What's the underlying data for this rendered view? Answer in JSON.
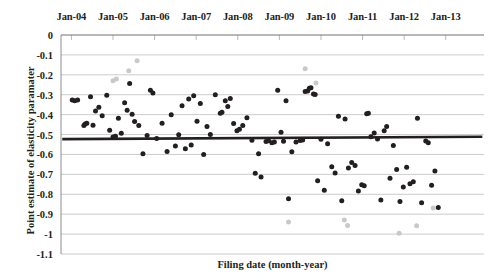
{
  "chart_data": {
    "type": "scatter",
    "title": "",
    "xlabel": "Filing date (month-year)",
    "ylabel": "Point estimate of elasticity paramater",
    "xlim": [
      2003.75,
      2013.92
    ],
    "ylim": [
      -1.1,
      0
    ],
    "grid": true,
    "legend": "none",
    "x_axis_position": "top",
    "y_ticks": [
      0,
      -0.1,
      -0.2,
      -0.3,
      -0.4,
      -0.5,
      -0.6,
      -0.7,
      -0.8,
      -0.9,
      -1,
      -1.1
    ],
    "y_tick_labels": [
      "0",
      "-0.1",
      "-0.2",
      "-0.3",
      "-0.4",
      "-0.5",
      "-0.6",
      "-0.7",
      "-0.8",
      "-0.9",
      "-1",
      "-1.1"
    ],
    "x_ticks": [
      2004,
      2005,
      2006,
      2007,
      2008,
      2009,
      2010,
      2011,
      2012,
      2013
    ],
    "x_tick_labels": [
      "Jan-04",
      "Jan-05",
      "Jan-06",
      "Jan-07",
      "Jan-08",
      "Jan-09",
      "Jan-10",
      "Jan-11",
      "Jan-12",
      "Jan-13"
    ],
    "series": [
      {
        "name": "point-estimates",
        "marker": "circle",
        "color": "#231f20",
        "points": [
          [
            2004.02,
            -0.327
          ],
          [
            2004.08,
            -0.33
          ],
          [
            2004.15,
            -0.327
          ],
          [
            2004.3,
            -0.455
          ],
          [
            2004.33,
            -0.447
          ],
          [
            2004.37,
            -0.443
          ],
          [
            2004.46,
            -0.31
          ],
          [
            2004.52,
            -0.453
          ],
          [
            2004.58,
            -0.382
          ],
          [
            2004.66,
            -0.363
          ],
          [
            2004.74,
            -0.405
          ],
          [
            2004.85,
            -0.303
          ],
          [
            2004.92,
            -0.478
          ],
          [
            2005.0,
            -0.512
          ],
          [
            2005.06,
            -0.508
          ],
          [
            2005.13,
            -0.418
          ],
          [
            2005.2,
            -0.493
          ],
          [
            2005.28,
            -0.34
          ],
          [
            2005.34,
            -0.378
          ],
          [
            2005.4,
            -0.244
          ],
          [
            2005.46,
            -0.398
          ],
          [
            2005.52,
            -0.434
          ],
          [
            2005.62,
            -0.455
          ],
          [
            2005.72,
            -0.597
          ],
          [
            2005.82,
            -0.505
          ],
          [
            2005.9,
            -0.277
          ],
          [
            2005.96,
            -0.291
          ],
          [
            2006.05,
            -0.52
          ],
          [
            2006.18,
            -0.443
          ],
          [
            2006.3,
            -0.585
          ],
          [
            2006.4,
            -0.4
          ],
          [
            2006.5,
            -0.558
          ],
          [
            2006.58,
            -0.501
          ],
          [
            2006.66,
            -0.355
          ],
          [
            2006.74,
            -0.571
          ],
          [
            2006.82,
            -0.322
          ],
          [
            2006.88,
            -0.553
          ],
          [
            2006.94,
            -0.305
          ],
          [
            2007.02,
            -0.433
          ],
          [
            2007.1,
            -0.344
          ],
          [
            2007.18,
            -0.6
          ],
          [
            2007.26,
            -0.459
          ],
          [
            2007.34,
            -0.5
          ],
          [
            2007.46,
            -0.3
          ],
          [
            2007.58,
            -0.393
          ],
          [
            2007.62,
            -0.388
          ],
          [
            2007.7,
            -0.33
          ],
          [
            2007.76,
            -0.359
          ],
          [
            2007.82,
            -0.319
          ],
          [
            2007.9,
            -0.445
          ],
          [
            2007.98,
            -0.481
          ],
          [
            2008.04,
            -0.474
          ],
          [
            2008.12,
            -0.454
          ],
          [
            2008.22,
            -0.416
          ],
          [
            2008.34,
            -0.529
          ],
          [
            2008.42,
            -0.694
          ],
          [
            2008.5,
            -0.597
          ],
          [
            2008.56,
            -0.713
          ],
          [
            2008.68,
            -0.535
          ],
          [
            2008.74,
            -0.531
          ],
          [
            2008.82,
            -0.541
          ],
          [
            2008.88,
            -0.538
          ],
          [
            2008.96,
            -0.277
          ],
          [
            2009.04,
            -0.489
          ],
          [
            2009.1,
            -0.534
          ],
          [
            2009.16,
            -0.33
          ],
          [
            2009.22,
            -0.822
          ],
          [
            2009.3,
            -0.586
          ],
          [
            2009.4,
            -0.538
          ],
          [
            2009.5,
            -0.53
          ],
          [
            2009.56,
            -0.528
          ],
          [
            2009.62,
            -0.284
          ],
          [
            2009.68,
            -0.281
          ],
          [
            2009.72,
            -0.268
          ],
          [
            2009.76,
            -0.265
          ],
          [
            2009.82,
            -0.296
          ],
          [
            2009.86,
            -0.299
          ],
          [
            2009.92,
            -0.732
          ],
          [
            2010.0,
            -0.524
          ],
          [
            2010.08,
            -0.78
          ],
          [
            2010.16,
            -0.546
          ],
          [
            2010.26,
            -0.662
          ],
          [
            2010.34,
            -0.693
          ],
          [
            2010.42,
            -0.408
          ],
          [
            2010.5,
            -0.833
          ],
          [
            2010.58,
            -0.422
          ],
          [
            2010.66,
            -0.668
          ],
          [
            2010.74,
            -0.641
          ],
          [
            2010.82,
            -0.655
          ],
          [
            2010.9,
            -0.783
          ],
          [
            2010.98,
            -0.752
          ],
          [
            2011.04,
            -0.757
          ],
          [
            2011.1,
            -0.395
          ],
          [
            2011.14,
            -0.393
          ],
          [
            2011.2,
            -0.511
          ],
          [
            2011.28,
            -0.492
          ],
          [
            2011.36,
            -0.522
          ],
          [
            2011.44,
            -0.829
          ],
          [
            2011.52,
            -0.481
          ],
          [
            2011.58,
            -0.459
          ],
          [
            2011.66,
            -0.719
          ],
          [
            2011.74,
            -0.555
          ],
          [
            2011.82,
            -0.676
          ],
          [
            2011.9,
            -0.836
          ],
          [
            2011.98,
            -0.763
          ],
          [
            2012.06,
            -0.664
          ],
          [
            2012.14,
            -0.747
          ],
          [
            2012.22,
            -0.737
          ],
          [
            2012.32,
            -0.418
          ],
          [
            2012.42,
            -0.843
          ],
          [
            2012.52,
            -0.533
          ],
          [
            2012.58,
            -0.541
          ],
          [
            2012.66,
            -0.755
          ],
          [
            2012.74,
            -0.683
          ],
          [
            2012.82,
            -0.866
          ]
        ]
      },
      {
        "name": "outlier-estimates",
        "marker": "circle",
        "color": "#c9c9c9",
        "points": [
          [
            2005.0,
            -0.23
          ],
          [
            2005.08,
            -0.221
          ],
          [
            2005.38,
            -0.18
          ],
          [
            2005.58,
            -0.129
          ],
          [
            2009.62,
            -0.169
          ],
          [
            2009.88,
            -0.241
          ],
          [
            2009.22,
            -0.939
          ],
          [
            2010.56,
            -0.929
          ],
          [
            2010.64,
            -0.957
          ],
          [
            2011.88,
            -0.996
          ],
          [
            2012.3,
            -0.958
          ],
          [
            2012.7,
            -0.869
          ]
        ]
      }
    ],
    "trend_line": {
      "name": "mean-elasticity-line",
      "color": "#231f20",
      "x_start": 2003.78,
      "y_start": -0.523,
      "x_end": 2013.88,
      "y_end": -0.511
    }
  }
}
